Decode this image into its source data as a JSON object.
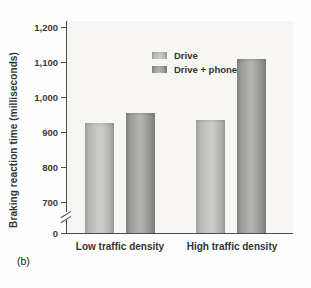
{
  "panel_label": "(b)",
  "chart_data": {
    "type": "bar",
    "title": "",
    "xlabel": "",
    "ylabel": "Braking reaction time (milliseconds)",
    "categories": [
      "Low traffic density",
      "High traffic density"
    ],
    "series": [
      {
        "name": "Drive",
        "values": [
          925,
          935
        ],
        "color": "#c4c4c2"
      },
      {
        "name": "Drive + phone",
        "values": [
          955,
          1110
        ],
        "color": "#a0a09e"
      }
    ],
    "ytick_labels": [
      "1,200",
      "1,100",
      "1,000",
      "900",
      "800",
      "700"
    ],
    "origin_label": "0",
    "ylim": [
      700,
      1200
    ],
    "axis_break": true,
    "grid": false,
    "legend_position": "top-left",
    "axis_color": "#4b4b4b",
    "plot_background": "#f7f6f2"
  }
}
